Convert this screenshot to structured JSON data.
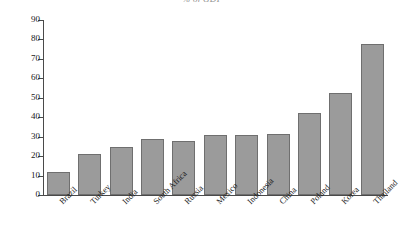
{
  "chart_data": {
    "type": "bar",
    "title": "% of GDP",
    "xlabel": "",
    "ylabel": "",
    "ylim": [
      0,
      90
    ],
    "grid": false,
    "legend": null,
    "yticks": [
      0,
      10,
      20,
      30,
      40,
      50,
      60,
      70,
      80,
      90
    ],
    "ytick_labels": [
      "0",
      "10",
      "20",
      "30",
      "40",
      "50",
      "60",
      "70",
      "80",
      "90"
    ],
    "categories": [
      "Brazil",
      "Turkey",
      "India",
      "South Africa",
      "Russia",
      "Mexico",
      "Indonesia",
      "China",
      "Poland",
      "Korea",
      "Thailand"
    ],
    "values": [
      12,
      21,
      24.5,
      29,
      28,
      31,
      31,
      31.5,
      42,
      52.5,
      77.5
    ],
    "bar_color": "#9b9b9b",
    "bar_edge_color": "#6f6f6f",
    "axis_color": "#4a4a4a",
    "background_color": "#ffffff"
  }
}
